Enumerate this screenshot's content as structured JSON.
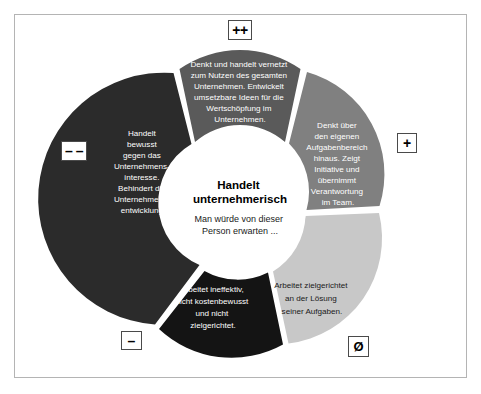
{
  "diagram": {
    "title": "Handelt unternehmerisch",
    "subtitle": "Man würde von dieser Person erwarten ...",
    "colors": {
      "frame_border": "#b4b4b4",
      "background": "#ffffff",
      "segment_top": "#5a5a5a",
      "segment_right": "#808080",
      "segment_bottom_right": "#c8c8c8",
      "segment_bottom_left": "#141414",
      "segment_left": "#2b2b2b",
      "badge_border": "#4a4a4a",
      "text_light": "#ffffff",
      "text_dark": "#1a1a1a"
    },
    "segments": [
      {
        "id": "top",
        "rating_badge": "++",
        "badge_name": "plus-plus",
        "fill": "#5a5a5a",
        "text_color": "light",
        "lines": [
          "Denkt und handelt vernetzt",
          "zum Nutzen des gesamten",
          "Unternehmen. Entwickelt",
          "umsetzbare Ideen für die",
          "Wertschöpfung im",
          "Unternehmen."
        ]
      },
      {
        "id": "right",
        "rating_badge": "+",
        "badge_name": "plus",
        "fill": "#808080",
        "text_color": "light",
        "lines": [
          "Denkt über",
          "den eigenen",
          "Aufgabenbereich",
          "hinaus. Zeigt",
          "Initiative und",
          "übernimmt",
          "Verantwortung",
          "im Team."
        ]
      },
      {
        "id": "bottom-right",
        "rating_badge": "Ø",
        "badge_name": "neutral",
        "fill": "#c8c8c8",
        "text_color": "dark",
        "lines": [
          "Arbeitet zielgerichtet",
          "an der Lösung",
          "seiner Aufgaben."
        ]
      },
      {
        "id": "bottom-left",
        "rating_badge": "–",
        "badge_name": "minus",
        "fill": "#141414",
        "text_color": "light",
        "lines": [
          "Arbeitet ineffektiv,",
          "nicht kostenbewusst",
          "und nicht",
          "zielgerichtet."
        ]
      },
      {
        "id": "left",
        "rating_badge": "– –",
        "badge_name": "minus-minus",
        "fill": "#2b2b2b",
        "text_color": "light",
        "lines": [
          "Handelt",
          "bewusst",
          "gegen das",
          "Unternehmens-",
          "interesse.",
          "Behindert die",
          "Unternehmens-",
          "entwicklung."
        ]
      }
    ]
  }
}
